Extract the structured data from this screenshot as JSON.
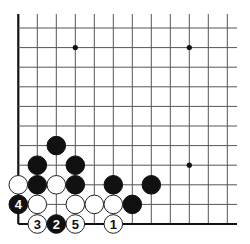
{
  "diagram": {
    "type": "go-board-fragment",
    "corner": "bottom-left",
    "grid": {
      "columns": 12,
      "rows": 11,
      "origin_x": 18.3,
      "origin_y": 28,
      "spacing_x": 19.0,
      "spacing_y": 19.6,
      "top_extend_y": 14,
      "right_extend_x": 237,
      "left_edge": true,
      "bottom_edge": true
    },
    "star_points": [
      {
        "col": 3,
        "row": 1
      },
      {
        "col": 9,
        "row": 1
      },
      {
        "col": 9,
        "row": 7
      }
    ],
    "stones": [
      {
        "col": 2,
        "row": 6,
        "color": "black",
        "label": ""
      },
      {
        "col": 1,
        "row": 7,
        "color": "black",
        "label": ""
      },
      {
        "col": 3,
        "row": 7,
        "color": "black",
        "label": ""
      },
      {
        "col": 0,
        "row": 8,
        "color": "white",
        "label": ""
      },
      {
        "col": 1,
        "row": 8,
        "color": "black",
        "label": ""
      },
      {
        "col": 2,
        "row": 8,
        "color": "white",
        "label": ""
      },
      {
        "col": 3,
        "row": 8,
        "color": "black",
        "label": ""
      },
      {
        "col": 5,
        "row": 8,
        "color": "black",
        "label": ""
      },
      {
        "col": 7,
        "row": 8,
        "color": "black",
        "label": ""
      },
      {
        "col": 0,
        "row": 9,
        "color": "black",
        "label": "4"
      },
      {
        "col": 1,
        "row": 9,
        "color": "white",
        "label": ""
      },
      {
        "col": 3,
        "row": 9,
        "color": "white",
        "label": ""
      },
      {
        "col": 4,
        "row": 9,
        "color": "white",
        "label": ""
      },
      {
        "col": 5,
        "row": 9,
        "color": "white",
        "label": ""
      },
      {
        "col": 6,
        "row": 9,
        "color": "black",
        "label": ""
      },
      {
        "col": 1,
        "row": 10,
        "color": "white",
        "label": "3"
      },
      {
        "col": 2,
        "row": 10,
        "color": "black",
        "label": "2"
      },
      {
        "col": 3,
        "row": 10,
        "color": "white",
        "label": "5"
      },
      {
        "col": 5,
        "row": 10,
        "color": "white",
        "label": "1"
      }
    ],
    "colors": {
      "black_stone": "#111111",
      "white_stone": "#ffffff",
      "grid": "#555555",
      "background": "#ffffff"
    }
  }
}
